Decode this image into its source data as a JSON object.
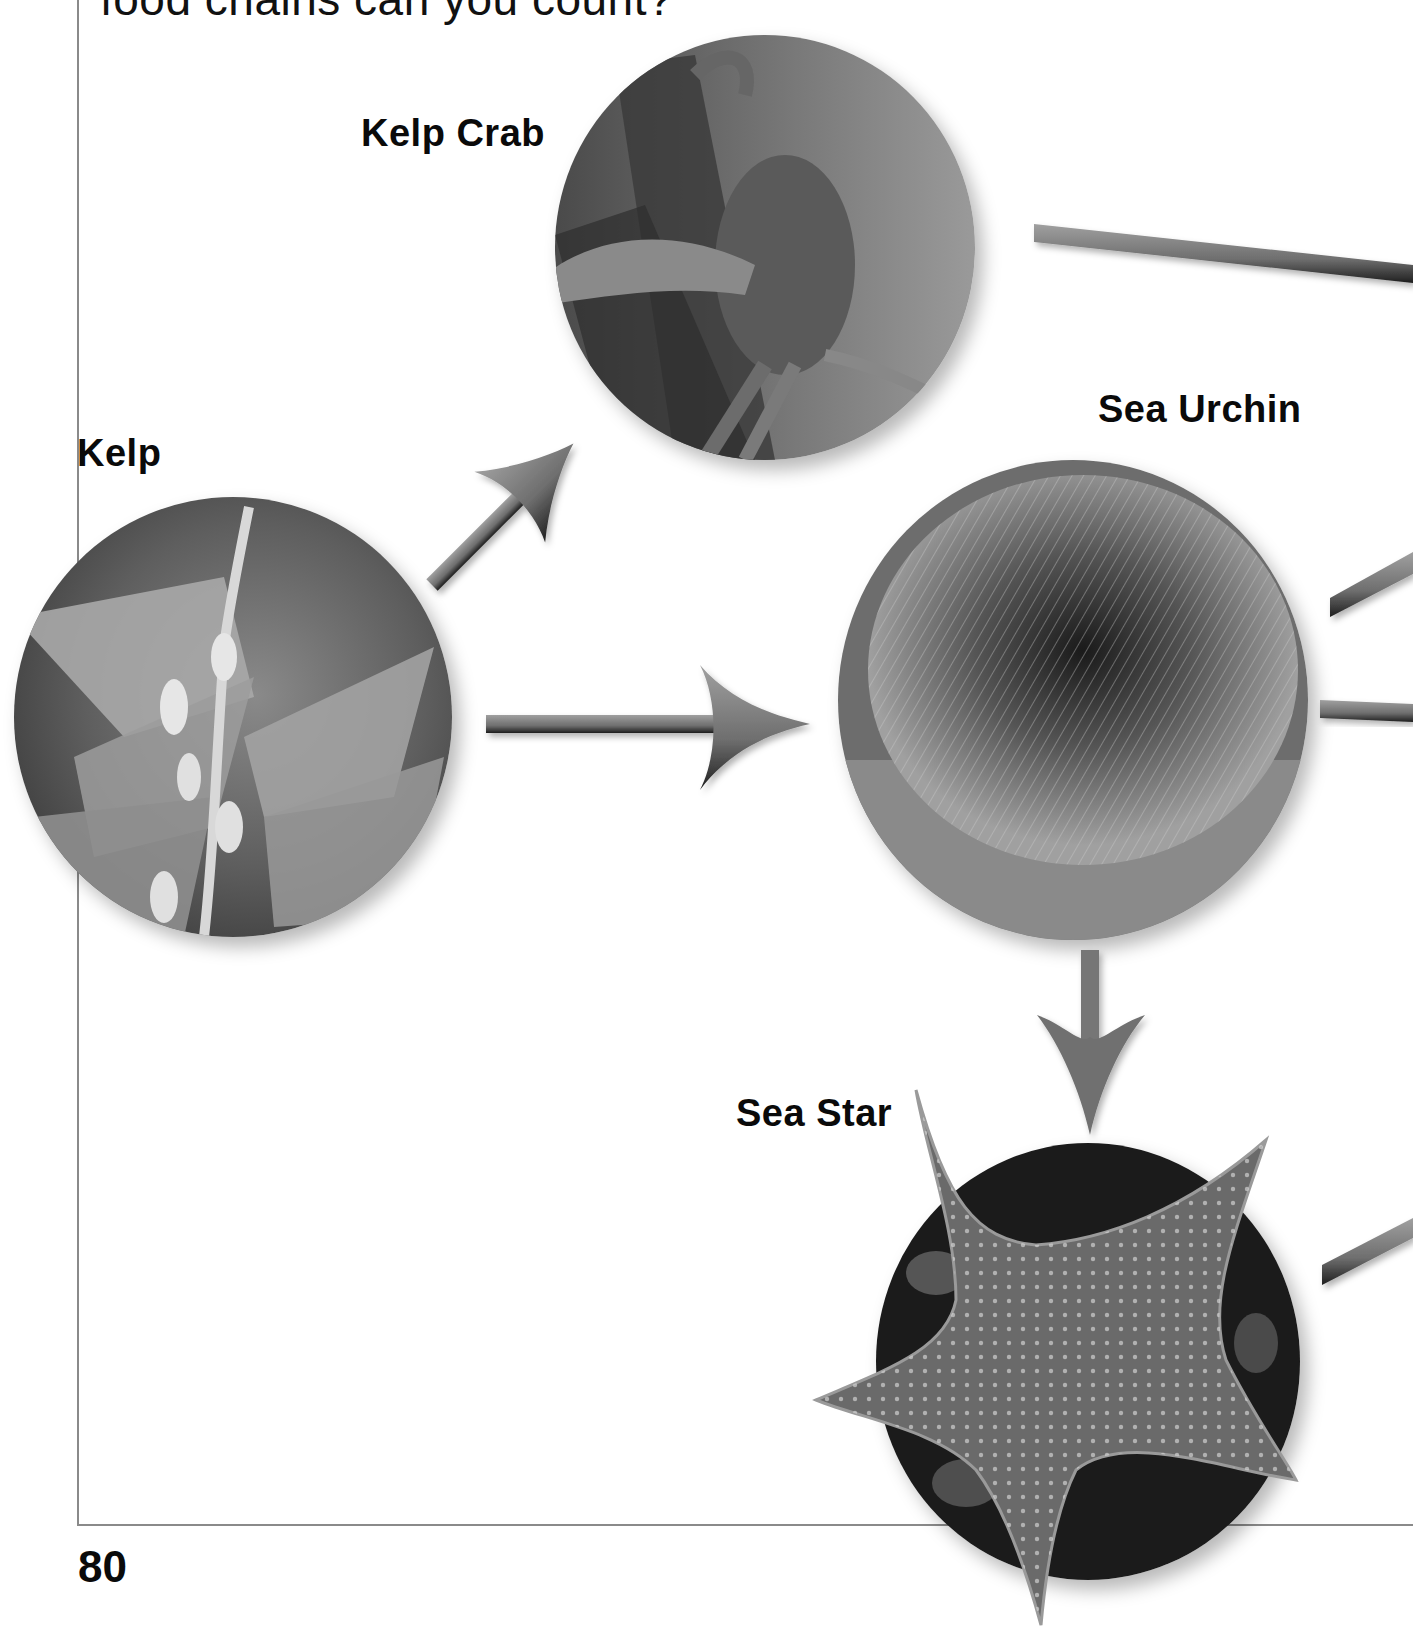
{
  "page": {
    "intro_text": "food chains can you count?",
    "page_number": "80"
  },
  "organisms": [
    {
      "id": "kelp",
      "label": "Kelp",
      "icon": "kelp-photo"
    },
    {
      "id": "kelp-crab",
      "label": "Kelp Crab",
      "icon": "kelp-crab-photo"
    },
    {
      "id": "sea-urchin",
      "label": "Sea Urchin",
      "icon": "sea-urchin-photo"
    },
    {
      "id": "sea-star",
      "label": "Sea Star",
      "icon": "sea-star-photo"
    }
  ],
  "arrows": [
    {
      "from": "Kelp",
      "to": "Kelp Crab"
    },
    {
      "from": "Kelp",
      "to": "Sea Urchin"
    },
    {
      "from": "Sea Urchin",
      "to": "Sea Star"
    }
  ],
  "offpage_connectors": [
    {
      "from": "Kelp Crab",
      "to": "off-page right"
    },
    {
      "from": "Sea Urchin",
      "to": "off-page right (upper)"
    },
    {
      "from": "Sea Urchin",
      "to": "off-page right (lower)"
    },
    {
      "from": "Sea Star",
      "to": "off-page right"
    }
  ],
  "colors": {
    "arrow_fill": "#7a7a7a",
    "arrow_shadow": "#2a2a2a",
    "frame_line": "#8a8a8a",
    "label_text": "#0a0a0a"
  }
}
